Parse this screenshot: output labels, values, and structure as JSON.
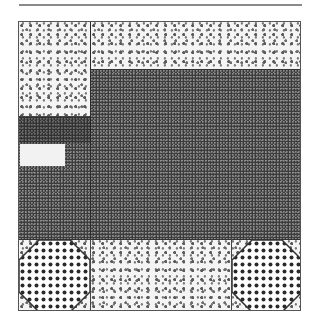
{
  "figure": {
    "colors": {
      "frame": "#555555",
      "light_texture": "#f4f4f4",
      "dark_texture": "#3c3c3c",
      "dot_pattern": "#2a2a2a",
      "white_block": "#f2f2f2",
      "top_rule": "#8a8a8a"
    },
    "regions": [
      {
        "name": "top-left-light-block",
        "texture": "light-blotchy"
      },
      {
        "name": "top-right-light-band",
        "texture": "light-blotchy"
      },
      {
        "name": "center-dark-field",
        "texture": "dark-stipple"
      },
      {
        "name": "left-white-rectangle",
        "texture": "plain-white"
      },
      {
        "name": "bottom-left-octagon",
        "texture": "polka-dot"
      },
      {
        "name": "bottom-center-light-band",
        "texture": "light-blotchy"
      },
      {
        "name": "bottom-right-octagon",
        "texture": "polka-dot"
      }
    ]
  }
}
